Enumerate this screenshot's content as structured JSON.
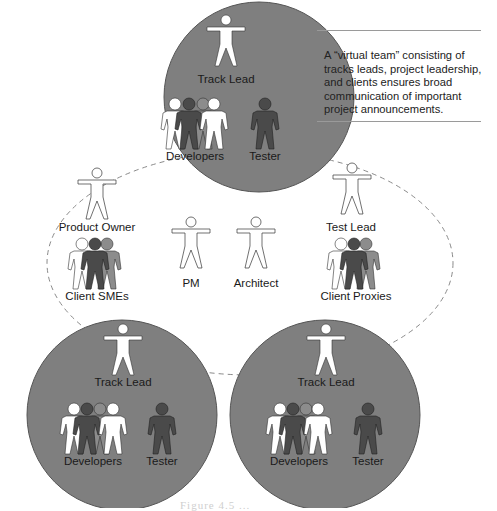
{
  "diagram": {
    "type": "virtual-team-structure",
    "colors": {
      "team_circle_fill": "#7f7f7f",
      "team_circle_stroke": "#555555",
      "dashed_ellipse": "#8a8a8a",
      "figure_white": "#ffffff",
      "figure_dark": "#4a4a4a",
      "figure_mid": "#8c8c8c",
      "label_text": "#1a1a1a"
    },
    "callout": {
      "text": "A “virtual team” consisting of tracks leads, project leadership, and clients ensures broad communication of important project announcements."
    },
    "teams": [
      {
        "id": "top",
        "lead_label": "Track Lead",
        "developers_label": "Developers",
        "tester_label": "Tester"
      },
      {
        "id": "bottom-left",
        "lead_label": "Track Lead",
        "developers_label": "Developers",
        "tester_label": "Tester"
      },
      {
        "id": "bottom-right",
        "lead_label": "Track Lead",
        "developers_label": "Developers",
        "tester_label": "Tester"
      }
    ],
    "virtual_team": {
      "members": [
        {
          "id": "product-owner",
          "label": "Product Owner"
        },
        {
          "id": "client-smes",
          "label": "Client SMEs"
        },
        {
          "id": "pm",
          "label": "PM"
        },
        {
          "id": "architect",
          "label": "Architect"
        },
        {
          "id": "test-lead",
          "label": "Test Lead"
        },
        {
          "id": "client-proxies",
          "label": "Client Proxies"
        }
      ]
    },
    "caption": {
      "text": "Figure 4.5  ..."
    }
  }
}
